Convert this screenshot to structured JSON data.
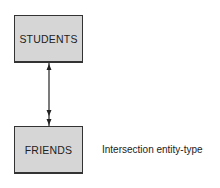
{
  "diagram": {
    "entities": [
      {
        "id": "students",
        "label": "STUDENTS"
      },
      {
        "id": "friends",
        "label": "FRIENDS"
      }
    ],
    "relationship": {
      "from": "STUDENTS",
      "to": "FRIENDS",
      "type": "bidirectional",
      "note": "one at top, many (double arrow) at bottom"
    },
    "annotation": "Intersection entity-type",
    "colors": {
      "box_fill": "#d6d6d6",
      "stroke": "#333333"
    }
  }
}
